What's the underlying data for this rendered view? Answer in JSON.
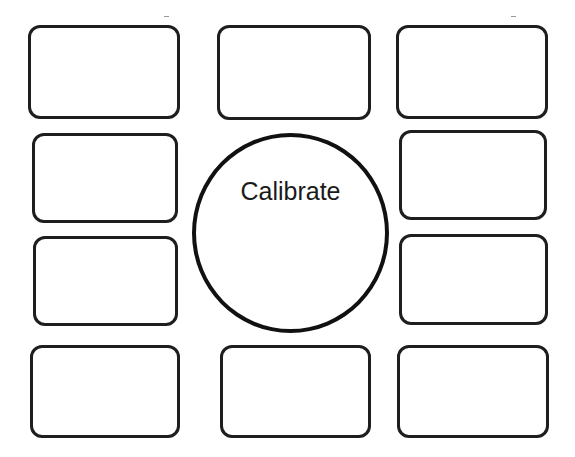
{
  "diagram": {
    "center": {
      "label": "Calibrate",
      "shape": "circle"
    },
    "boxes": [
      {
        "id": "top-left",
        "label": ""
      },
      {
        "id": "top-center",
        "label": ""
      },
      {
        "id": "top-right",
        "label": ""
      },
      {
        "id": "mid-upper-left",
        "label": ""
      },
      {
        "id": "mid-upper-right",
        "label": ""
      },
      {
        "id": "mid-lower-left",
        "label": ""
      },
      {
        "id": "mid-lower-right",
        "label": ""
      },
      {
        "id": "bottom-left",
        "label": ""
      },
      {
        "id": "bottom-center",
        "label": ""
      },
      {
        "id": "bottom-right",
        "label": ""
      }
    ],
    "colors": {
      "stroke": "#1e1e1e",
      "background": "#ffffff"
    }
  }
}
